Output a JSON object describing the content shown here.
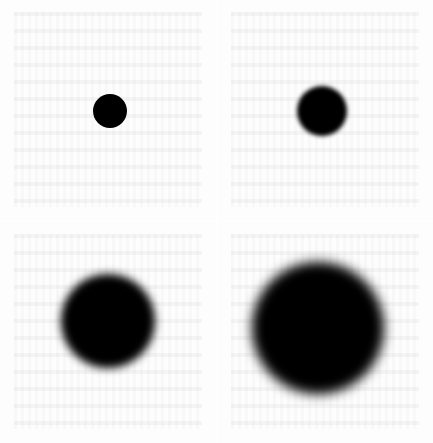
{
  "figure": {
    "layout": "2x2 grid",
    "background": "#ffffff",
    "panels": [
      {
        "position": "top-left",
        "label": "small sharp dot",
        "dot_radius_px": 17,
        "blur_px": 0.5
      },
      {
        "position": "top-right",
        "label": "medium slightly blurred dot",
        "dot_radius_px": 25,
        "blur_px": 2
      },
      {
        "position": "bottom-left",
        "label": "large blurred dot",
        "dot_radius_px": 47,
        "blur_px": 4
      },
      {
        "position": "bottom-right",
        "label": "largest heavily blurred dot",
        "dot_radius_px": 66,
        "blur_px": 6
      }
    ],
    "dot_color": "#000000"
  }
}
